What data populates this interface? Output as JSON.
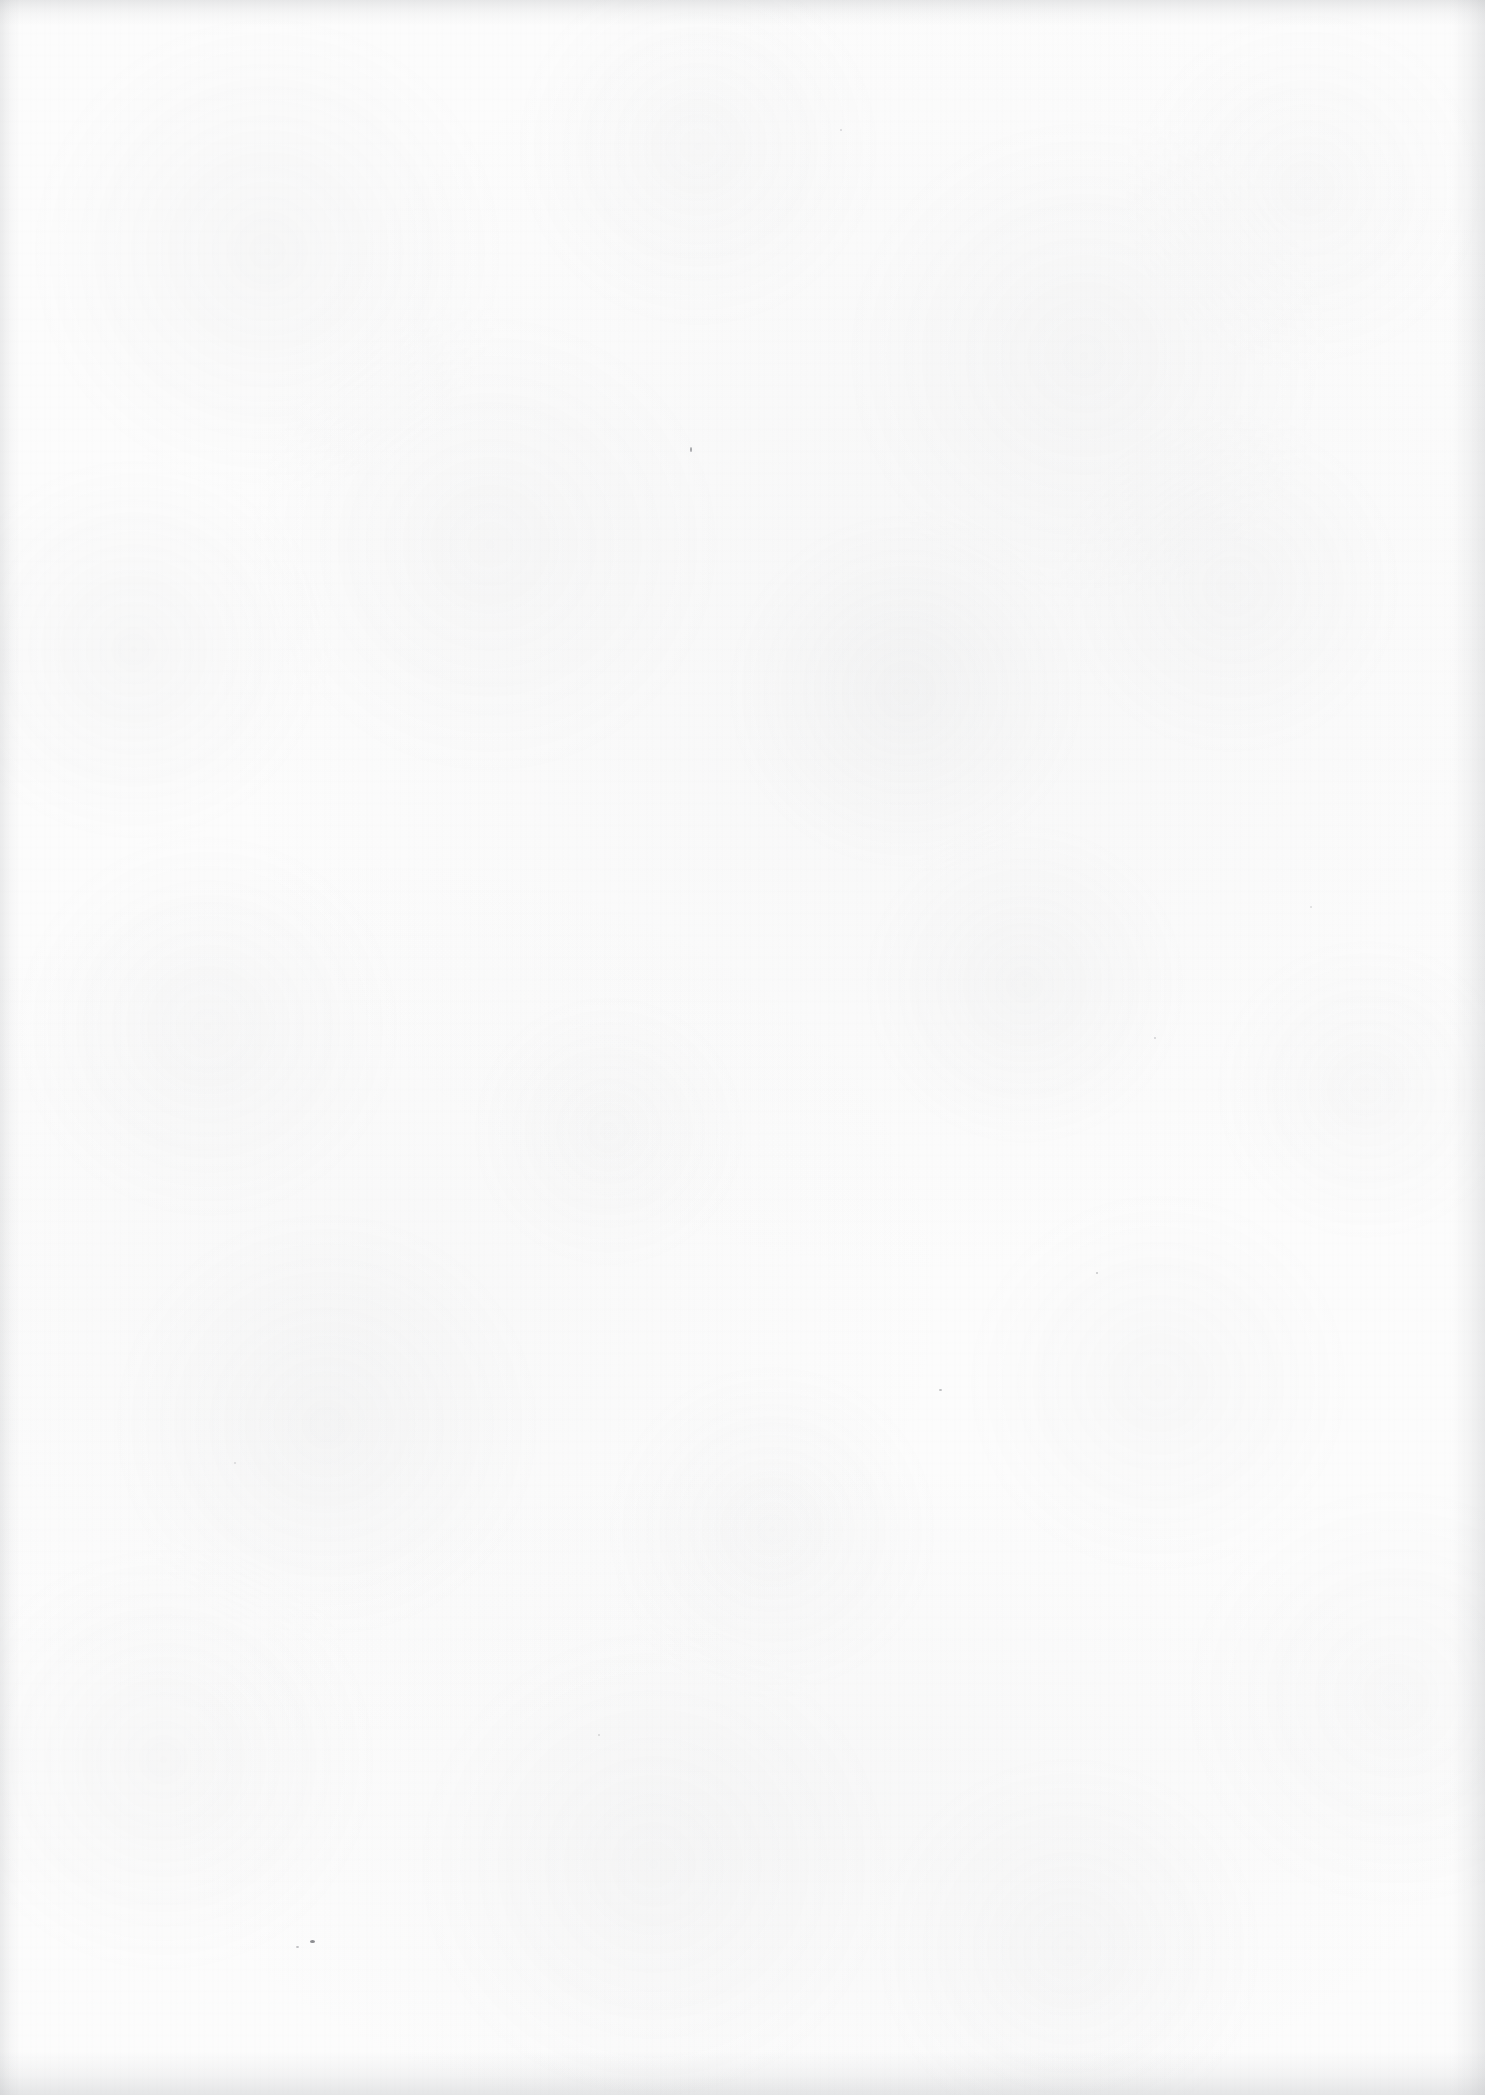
{
  "page": {
    "kind": "blank-scanned-page",
    "width_px": 1485,
    "height_px": 2095,
    "orientation": "portrait",
    "text_content": "",
    "visible_text_blocks": [],
    "colors": {
      "paper_base": "#fcfcfc",
      "grain": "#aaacb0",
      "edge_shadow": "#9295a0",
      "speck": "#6f7176"
    }
  },
  "surface": {
    "base_tone_label": "",
    "grain_label": "",
    "drift_label": ""
  },
  "edges": {
    "top_label": "",
    "bottom_label": "",
    "left_label": "",
    "right_label": ""
  },
  "specks": [
    {
      "x": 310,
      "y": 1940,
      "w": 5,
      "h": 3,
      "opacity": 0.8
    },
    {
      "x": 296,
      "y": 1946,
      "w": 3,
      "h": 2,
      "opacity": 0.42
    },
    {
      "x": 690,
      "y": 447,
      "w": 2,
      "h": 5,
      "opacity": 0.62
    },
    {
      "x": 939,
      "y": 1389,
      "w": 3,
      "h": 2,
      "opacity": 0.45
    },
    {
      "x": 1096,
      "y": 1272,
      "w": 2,
      "h": 2,
      "opacity": 0.38
    },
    {
      "x": 1154,
      "y": 1037,
      "w": 2,
      "h": 2,
      "opacity": 0.3
    },
    {
      "x": 840,
      "y": 129,
      "w": 2,
      "h": 2,
      "opacity": 0.26
    },
    {
      "x": 234,
      "y": 1462,
      "w": 2,
      "h": 2,
      "opacity": 0.24
    },
    {
      "x": 1310,
      "y": 906,
      "w": 2,
      "h": 2,
      "opacity": 0.22
    },
    {
      "x": 598,
      "y": 1734,
      "w": 2,
      "h": 2,
      "opacity": 0.25
    }
  ]
}
